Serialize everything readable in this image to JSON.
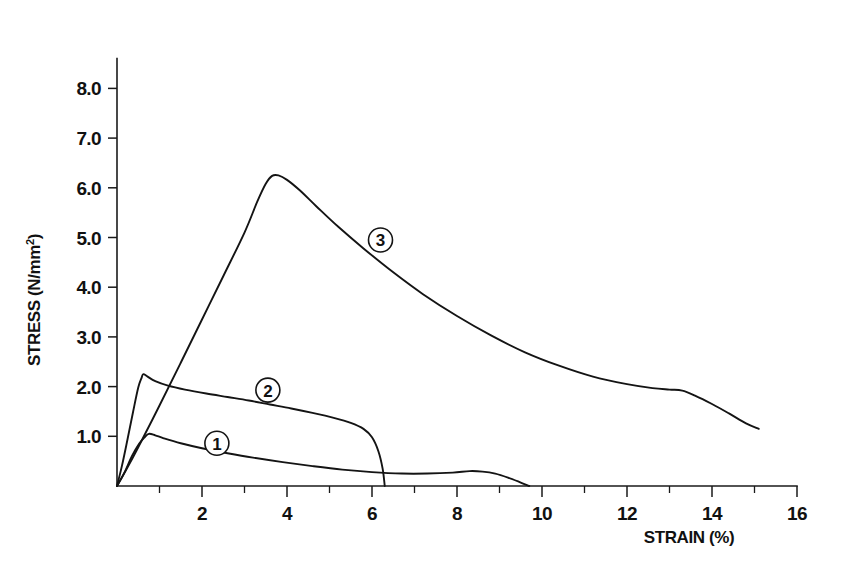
{
  "chart_data": {
    "type": "line",
    "title": "",
    "xlabel": "STRAIN (%)",
    "ylabel": "STRESS (N/mm²)",
    "ylabel_base": "STRESS (N/mm",
    "ylabel_sup": "2",
    "ylabel_close": ")",
    "xlim": [
      0,
      16
    ],
    "ylim": [
      0,
      8.6
    ],
    "grid": false,
    "legend": "inline-circled-numbers",
    "x_ticks_major": [
      2,
      4,
      6,
      8,
      10,
      12,
      14,
      16
    ],
    "x_tick_labels": [
      "2",
      "4",
      "6",
      "8",
      "10",
      "12",
      "14",
      "16"
    ],
    "x_ticks_minor": [
      1,
      3,
      5,
      7,
      9,
      11,
      13,
      15
    ],
    "y_ticks_major": [
      1.0,
      2.0,
      3.0,
      4.0,
      5.0,
      6.0,
      7.0,
      8.0
    ],
    "y_tick_labels": [
      "1.0",
      "2.0",
      "3.0",
      "4.0",
      "5.0",
      "6.0",
      "7.0",
      "8.0"
    ],
    "series": [
      {
        "name": "1",
        "label": "①",
        "label_x": 2.35,
        "label_y": 0.86,
        "peak_strain": 0.75,
        "peak_stress": 1.05,
        "end_strain": 9.7,
        "points": [
          [
            0.0,
            0.0
          ],
          [
            0.18,
            0.28
          ],
          [
            0.35,
            0.6
          ],
          [
            0.52,
            0.85
          ],
          [
            0.65,
            0.98
          ],
          [
            0.75,
            1.05
          ],
          [
            0.9,
            1.02
          ],
          [
            1.1,
            0.96
          ],
          [
            1.5,
            0.86
          ],
          [
            2.0,
            0.76
          ],
          [
            2.6,
            0.66
          ],
          [
            3.2,
            0.57
          ],
          [
            3.9,
            0.48
          ],
          [
            4.6,
            0.4
          ],
          [
            5.3,
            0.33
          ],
          [
            6.0,
            0.28
          ],
          [
            6.7,
            0.25
          ],
          [
            7.3,
            0.25
          ],
          [
            7.9,
            0.27
          ],
          [
            8.3,
            0.3
          ],
          [
            8.6,
            0.29
          ],
          [
            8.9,
            0.25
          ],
          [
            9.2,
            0.17
          ],
          [
            9.5,
            0.07
          ],
          [
            9.7,
            0.0
          ]
        ]
      },
      {
        "name": "2",
        "label": "②",
        "label_x": 3.55,
        "label_y": 1.93,
        "peak_strain": 0.62,
        "peak_stress": 2.25,
        "end_strain": 6.3,
        "points": [
          [
            0.0,
            0.0
          ],
          [
            0.12,
            0.42
          ],
          [
            0.25,
            0.95
          ],
          [
            0.38,
            1.5
          ],
          [
            0.5,
            1.98
          ],
          [
            0.58,
            2.18
          ],
          [
            0.62,
            2.25
          ],
          [
            0.72,
            2.2
          ],
          [
            0.9,
            2.11
          ],
          [
            1.2,
            2.02
          ],
          [
            1.6,
            1.94
          ],
          [
            2.1,
            1.86
          ],
          [
            2.6,
            1.79
          ],
          [
            3.1,
            1.72
          ],
          [
            3.6,
            1.64
          ],
          [
            4.1,
            1.56
          ],
          [
            4.6,
            1.47
          ],
          [
            5.1,
            1.37
          ],
          [
            5.5,
            1.27
          ],
          [
            5.8,
            1.15
          ],
          [
            6.0,
            0.98
          ],
          [
            6.15,
            0.7
          ],
          [
            6.25,
            0.35
          ],
          [
            6.3,
            0.0
          ]
        ]
      },
      {
        "name": "3",
        "label": "③",
        "label_x": 6.2,
        "label_y": 4.95,
        "peak_strain": 3.6,
        "peak_stress": 6.25,
        "end_strain": 15.1,
        "end_stress": 1.15,
        "points": [
          [
            0.0,
            0.0
          ],
          [
            0.2,
            0.3
          ],
          [
            0.5,
            0.78
          ],
          [
            1.0,
            1.62
          ],
          [
            1.5,
            2.48
          ],
          [
            2.0,
            3.35
          ],
          [
            2.5,
            4.22
          ],
          [
            3.0,
            5.1
          ],
          [
            3.3,
            5.72
          ],
          [
            3.5,
            6.08
          ],
          [
            3.65,
            6.24
          ],
          [
            3.8,
            6.25
          ],
          [
            4.0,
            6.16
          ],
          [
            4.3,
            5.95
          ],
          [
            4.7,
            5.62
          ],
          [
            5.2,
            5.22
          ],
          [
            5.8,
            4.78
          ],
          [
            6.5,
            4.3
          ],
          [
            7.2,
            3.86
          ],
          [
            8.0,
            3.42
          ],
          [
            8.8,
            3.03
          ],
          [
            9.6,
            2.69
          ],
          [
            10.4,
            2.42
          ],
          [
            11.2,
            2.2
          ],
          [
            12.0,
            2.05
          ],
          [
            12.6,
            1.97
          ],
          [
            13.0,
            1.94
          ],
          [
            13.3,
            1.92
          ],
          [
            13.6,
            1.82
          ],
          [
            14.0,
            1.65
          ],
          [
            14.4,
            1.46
          ],
          [
            14.8,
            1.26
          ],
          [
            15.1,
            1.15
          ]
        ]
      }
    ]
  }
}
